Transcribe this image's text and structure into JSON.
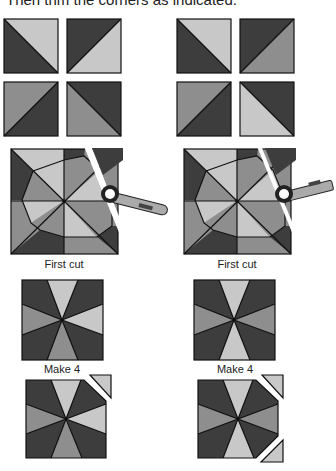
{
  "header": {
    "text": "Then trim the corners as indicated."
  },
  "colors": {
    "dark": "#3d3d3d",
    "medium": "#8e8e8e",
    "light": "#c8c8c8",
    "outline": "#111111"
  },
  "captions": {
    "left_first_cut": "First cut",
    "right_first_cut": "First cut",
    "left_make": "Make 4",
    "right_make": "Make 4"
  }
}
